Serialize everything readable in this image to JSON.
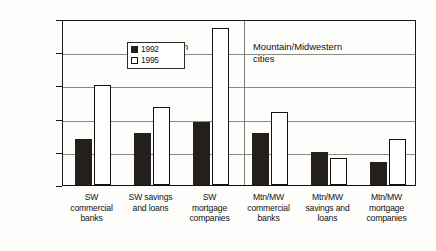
{
  "chart_data": {
    "type": "bar",
    "title": "",
    "xlabel": "",
    "ylabel": "",
    "ylim": [
      0,
      250000
    ],
    "yticks": [
      0,
      50000,
      100000,
      150000,
      200000,
      250000
    ],
    "ytick_labels": [
      "0",
      "50,000",
      "100,000",
      "150,000",
      "200,000",
      "250,000"
    ],
    "grid": true,
    "legend_position": "top-left",
    "categories": [
      "SW commercial banks",
      "SW savings and loans",
      "SW mortgage companies",
      "Mtn/MW commercial banks",
      "Mtn/MW savings and loans",
      "Mtn/MW mortgage companies"
    ],
    "category_lines": [
      [
        "SW",
        "commercial",
        "banks"
      ],
      [
        "SW savings",
        "and loans"
      ],
      [
        "SW",
        "mortgage",
        "companies"
      ],
      [
        "Mtn/MW",
        "commercial",
        "banks"
      ],
      [
        "Mtn/MW",
        "savings and",
        "loans"
      ],
      [
        "Mtn/MW",
        "mortgage",
        "companies"
      ]
    ],
    "series": [
      {
        "name": "1992",
        "color": "#241f1c",
        "values": [
          70000,
          78000,
          95000,
          78000,
          50000,
          35000
        ]
      },
      {
        "name": "1995",
        "color": "#ffffff",
        "values": [
          150000,
          117000,
          237000,
          110000,
          41000,
          70000
        ]
      }
    ],
    "annotations": [
      {
        "text_lines": [
          "Southwestern",
          "cities"
        ],
        "group": "southwestern"
      },
      {
        "text_lines": [
          "Mountain/Midwestern",
          "cities"
        ],
        "group": "mountain-midwestern"
      }
    ]
  },
  "legend": {
    "items": [
      {
        "label": "1992",
        "swatch": "filled-square-icon"
      },
      {
        "label": "1995",
        "swatch": "open-square-icon"
      }
    ]
  },
  "annotations": {
    "southwestern_line1": "Southwestern",
    "southwestern_line2": "cities",
    "mountain_line1": "Mountain/Midwestern",
    "mountain_line2": "cities"
  }
}
